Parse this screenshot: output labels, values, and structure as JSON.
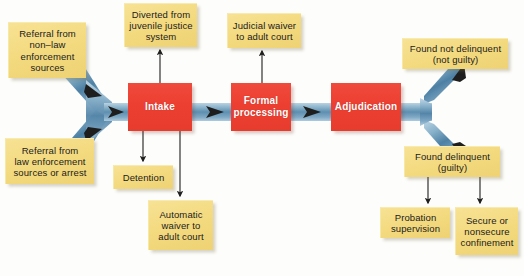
{
  "diagram": {
    "colors": {
      "box_yellow": "#f3d97d",
      "box_red": "#ec3f32",
      "pipe_blue": "#7fa8c4",
      "pipe_blue_dark": "#4a7ea3",
      "connector": "#2b2b2b",
      "background": "#fdfdfb"
    },
    "stages": [
      {
        "id": "intake",
        "label": "Intake"
      },
      {
        "id": "formal_processing",
        "label": "Formal\nprocessing"
      },
      {
        "id": "adjudication",
        "label": "Adjudication"
      }
    ],
    "inputs": [
      {
        "id": "referral_non_law",
        "label": "Referral from\nnon–law\nenforcement\nsources"
      },
      {
        "id": "referral_law",
        "label": "Referral from\nlaw enforcement\nsources or arrest"
      }
    ],
    "top_outcomes": [
      {
        "id": "diverted",
        "label": "Diverted from\njuvenile justice\nsystem"
      },
      {
        "id": "judicial_waiver",
        "label": "Judicial waiver\nto adult court"
      }
    ],
    "bottom_outcomes": [
      {
        "id": "detention",
        "label": "Detention"
      },
      {
        "id": "automatic_waiver",
        "label": "Automatic\nwaiver to\nadult court"
      }
    ],
    "verdicts": [
      {
        "id": "not_delinquent",
        "label": "Found not delinquent\n(not guilty)"
      },
      {
        "id": "delinquent",
        "label": "Found delinquent\n(guilty)"
      }
    ],
    "dispositions": [
      {
        "id": "probation",
        "label": "Probation\nsupervision"
      },
      {
        "id": "confinement",
        "label": "Secure or\nnonsecure\nconfinement"
      }
    ]
  }
}
